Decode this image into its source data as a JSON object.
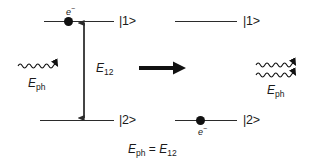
{
  "diagram": {
    "background_color": "#ffffff",
    "stroke_color": "#2b2b2b",
    "electron_color": "#111111"
  },
  "left_panel": {
    "name": "before-stimulated-emission",
    "upper_level": {
      "ket_label": "|1>",
      "electron_label": "e",
      "electron_charge": "−",
      "occupied": true
    },
    "lower_level": {
      "ket_label": "|2>",
      "occupied": false
    },
    "transition": {
      "label": "E",
      "sublabel": "12",
      "arrow_type": "double-headed-vertical"
    },
    "incoming_photon": {
      "label": "E",
      "sublabel": "ph",
      "count": 1,
      "direction": "right"
    }
  },
  "process_arrow": {
    "name": "process-arrow",
    "direction": "right"
  },
  "right_panel": {
    "name": "after-stimulated-emission",
    "upper_level": {
      "ket_label": "|1>",
      "occupied": false
    },
    "lower_level": {
      "ket_label": "|2>",
      "electron_label": "e",
      "electron_charge": "−",
      "occupied": true
    },
    "outgoing_photons": {
      "label": "E",
      "sublabel": "ph",
      "count": 2,
      "direction": "right"
    }
  },
  "equation": {
    "left_symbol": "E",
    "left_sub": "ph",
    "operator": "=",
    "right_symbol": "E",
    "right_sub": "12"
  }
}
